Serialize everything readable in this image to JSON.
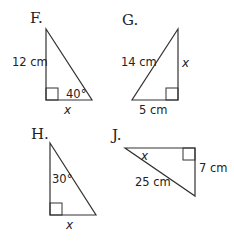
{
  "problems": {
    "F": {
      "label": "F.",
      "side_label": "12 cm",
      "angle_label": "40°",
      "unknown": "x"
    },
    "G": {
      "label": "G.",
      "hyp_label": "14 cm",
      "base_label": "5 cm",
      "unknown": "x"
    },
    "H": {
      "label": "H.",
      "angle_label": "30°",
      "unknown": "x"
    },
    "J": {
      "label": "J.",
      "hyp_label": "25 cm",
      "side_label": "7 cm",
      "unknown": "x"
    }
  }
}
